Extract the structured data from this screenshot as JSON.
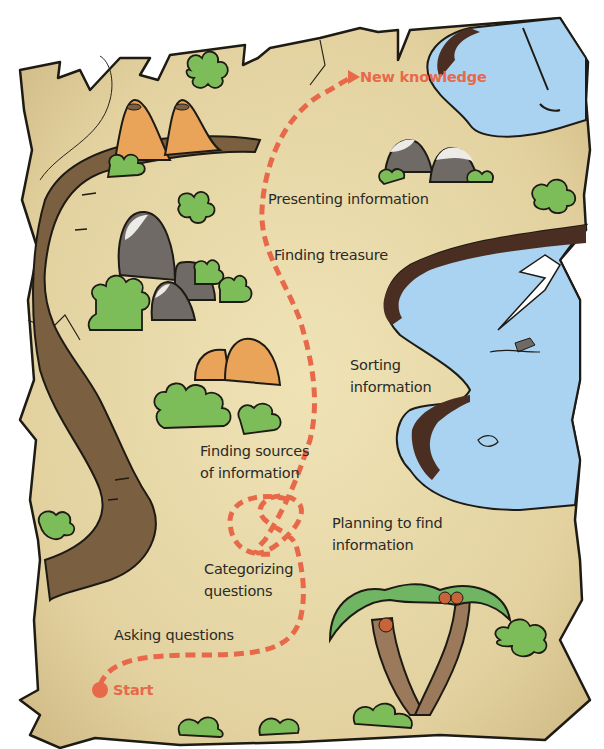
{
  "diagram": {
    "type": "treasure-map-process",
    "start_label": "Start",
    "end_label": "New knowledge",
    "steps": [
      {
        "order": 1,
        "label": "Asking questions"
      },
      {
        "order": 2,
        "label": "Categorizing questions",
        "lines": [
          "Categorizing",
          "questions"
        ]
      },
      {
        "order": 3,
        "label": "Planning to find information",
        "lines": [
          "Planning to find",
          "information"
        ]
      },
      {
        "order": 4,
        "label": "Finding sources of information",
        "lines": [
          "Finding sources",
          "of information"
        ]
      },
      {
        "order": 5,
        "label": "Sorting information",
        "lines": [
          "Sorting",
          "information"
        ]
      },
      {
        "order": 6,
        "label": "Finding treasure"
      },
      {
        "order": 7,
        "label": "Presenting information"
      }
    ],
    "colors": {
      "path": "#e8694a",
      "parchment": "#e6d7a6",
      "road": "#7a5f41",
      "water": "#a9d3f0",
      "bush": "#7cbd5a",
      "rock": "#6f6a66",
      "volcano": "#e9a45a",
      "text": "#2b2a26"
    }
  }
}
